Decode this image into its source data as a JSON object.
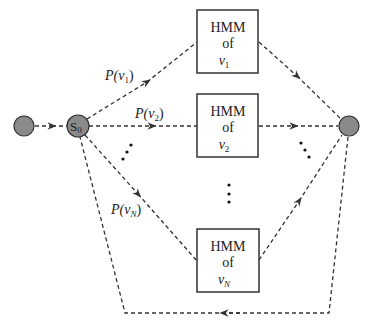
{
  "diagram": {
    "type": "hmm-word-recognition-network",
    "colors": {
      "line": "#333333",
      "node_fill": "#8a8a8a",
      "node_stroke": "#333333",
      "box_stroke": "#333333",
      "text": "#222222",
      "background": "#ffffff"
    },
    "nodes": {
      "start": {
        "label": ""
      },
      "s0": {
        "label_main": "S",
        "label_sub": "0"
      },
      "end": {
        "label": ""
      }
    },
    "boxes": [
      {
        "line1": "HMM",
        "line2": "of",
        "var": "v",
        "sub": "1"
      },
      {
        "line1": "HMM",
        "line2": "of",
        "var": "v",
        "sub": "2"
      },
      {
        "line1": "HMM",
        "line2": "of",
        "var": "v",
        "sub": "N"
      }
    ],
    "edge_labels": [
      {
        "prefix": "P(",
        "var": "v",
        "sub": "1",
        "suffix": ")"
      },
      {
        "prefix": "P(",
        "var": "v",
        "sub": "2",
        "suffix": ")"
      },
      {
        "prefix": "P(",
        "var": "v",
        "sub": "N",
        "suffix": ")"
      }
    ],
    "ellipsis": "⋮"
  }
}
